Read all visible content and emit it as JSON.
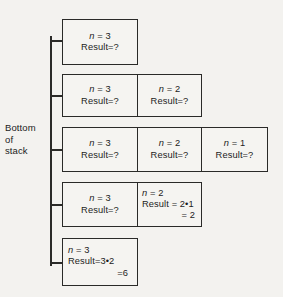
{
  "diagram": {
    "stack_label": {
      "line1": "Bottom",
      "line2": "of",
      "line3": "stack"
    },
    "colors": {
      "background": "#f3f2ef",
      "box_fill": "#f5f4f1",
      "stroke": "#2a2a28",
      "text": "#1c1c1c"
    },
    "rows": [
      {
        "id": "stack-state-1",
        "cells": [
          {
            "var_label": "n",
            "var_value": "= 3",
            "lines": [
              "Result=?"
            ]
          }
        ]
      },
      {
        "id": "stack-state-2",
        "cells": [
          {
            "var_label": "n",
            "var_value": "= 3",
            "lines": [
              "Result=?"
            ]
          },
          {
            "var_label": "n",
            "var_value": "= 2",
            "lines": [
              "Result=?"
            ]
          }
        ]
      },
      {
        "id": "stack-state-3",
        "cells": [
          {
            "var_label": "n",
            "var_value": "= 3",
            "lines": [
              "Result=?"
            ]
          },
          {
            "var_label": "n",
            "var_value": "= 2",
            "lines": [
              "Result=?"
            ]
          },
          {
            "var_label": "n",
            "var_value": "= 1",
            "lines": [
              "Result=?"
            ]
          }
        ]
      },
      {
        "id": "stack-state-4",
        "cells": [
          {
            "var_label": "n",
            "var_value": "= 3",
            "lines": [
              "Result=?"
            ]
          },
          {
            "var_label": "n",
            "var_value": "= 2",
            "lines": [
              "Result = 2•1",
              "= 2"
            ]
          }
        ]
      },
      {
        "id": "stack-state-5",
        "cells": [
          {
            "var_label": "n",
            "var_value": "= 3",
            "lines": [
              "Result=3•2",
              "=6"
            ]
          }
        ]
      }
    ]
  }
}
